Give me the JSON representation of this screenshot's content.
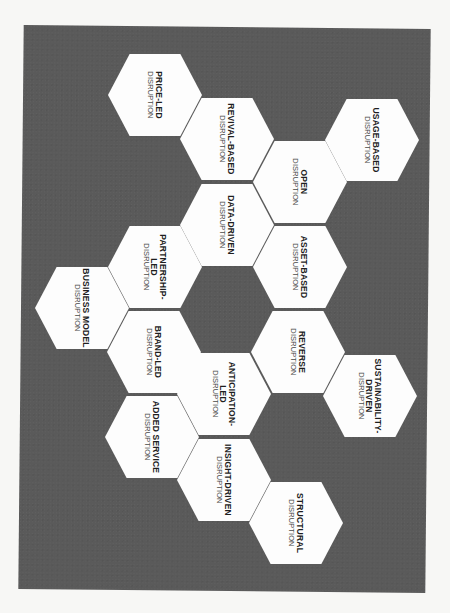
{
  "diagram": {
    "colors": {
      "page_background": "#f7f7f5",
      "panel_background": "#5a5a5a",
      "hexagon_fill": "#fdfdfd",
      "text": "#1e1e1e"
    },
    "subtitle": "DISRUPTION",
    "hexagons": [
      {
        "title": "PRICE-LED",
        "subtitle": "DISRUPTION",
        "cx": 155,
        "cy": 95
      },
      {
        "title": "REVIVAL-BASED",
        "subtitle": "DISRUPTION",
        "cx": 227,
        "cy": 139
      },
      {
        "title": "USAGE-BASED",
        "subtitle": "DISRUPTION",
        "cx": 372,
        "cy": 140
      },
      {
        "title": "OPEN",
        "subtitle": "DISRUPTION",
        "cx": 300,
        "cy": 182
      },
      {
        "title": "DATA-DRIVEN",
        "subtitle": "DISRUPTION",
        "cx": 227,
        "cy": 225
      },
      {
        "title": "PARTNERSHIP-LED",
        "subtitle": "DISRUPTION",
        "cx": 155,
        "cy": 267
      },
      {
        "title": "ASSET-BASED",
        "subtitle": "DISRUPTION",
        "cx": 300,
        "cy": 267
      },
      {
        "title": "BUSINESS MODEL",
        "subtitle": "DISRUPTION",
        "cx": 82,
        "cy": 308
      },
      {
        "title": "BRAND-LED",
        "subtitle": "DISRUPTION",
        "cx": 154,
        "cy": 352
      },
      {
        "title": "REVERSE",
        "subtitle": "DISRUPTION",
        "cx": 298,
        "cy": 352
      },
      {
        "title": "ANTICIPATION-LED",
        "subtitle": "DISRUPTION",
        "cx": 224,
        "cy": 394
      },
      {
        "title": "SUSTAINABILITY-DRIVEN",
        "subtitle": "DISRUPTION",
        "cx": 370,
        "cy": 396
      },
      {
        "title": "ADDED SERVICE",
        "subtitle": "DISRUPTION",
        "cx": 152,
        "cy": 437
      },
      {
        "title": "INSIGHT-DRIVEN",
        "subtitle": "DISRUPTION",
        "cx": 224,
        "cy": 480
      },
      {
        "title": "STRUCTURAL",
        "subtitle": "DISRUPTION",
        "cx": 296,
        "cy": 523
      }
    ]
  }
}
